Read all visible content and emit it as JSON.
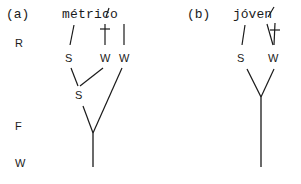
{
  "panel_a": {
    "label": "(a)",
    "word_parts": [
      "mé",
      "t",
      "r",
      "i",
      "c",
      "o"
    ],
    "word": "métrico",
    "level_labels": {
      "R": "R",
      "F": "F",
      "W": "W"
    },
    "nodes": {
      "s_top": "S",
      "w_mid": "W",
      "w_right": "W",
      "s_lower": "S"
    },
    "dagger": "†"
  },
  "panel_b": {
    "label": "(b)",
    "word": "jóven",
    "nodes": {
      "s": "S",
      "w": "W"
    },
    "dagger": "†"
  },
  "colors": {
    "ink": "#1a1a1a",
    "background": "#ffffff"
  }
}
